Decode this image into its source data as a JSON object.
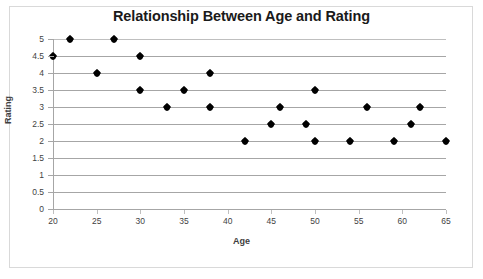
{
  "chart_data": {
    "type": "scatter",
    "title": "Relationship Between Age and Rating",
    "xlabel": "Age",
    "ylabel": "Rating",
    "xlim": [
      20,
      65
    ],
    "ylim": [
      0,
      5
    ],
    "xticks": [
      20,
      25,
      30,
      35,
      40,
      45,
      50,
      55,
      60,
      65
    ],
    "yticks": [
      0,
      0.5,
      1,
      1.5,
      2,
      2.5,
      3,
      3.5,
      4,
      4.5,
      5
    ],
    "ytick_labels": [
      "0",
      "0.5",
      "1",
      "1.5",
      "2",
      "2.5",
      "3",
      "3.5",
      "4",
      "4.5",
      "5"
    ],
    "xtick_labels": [
      "20",
      "25",
      "30",
      "35",
      "40",
      "45",
      "50",
      "55",
      "60",
      "65"
    ],
    "grid": true,
    "grid_axis": "y",
    "legend": false,
    "marker": "diamond",
    "marker_color": "#000000",
    "points": [
      {
        "x": 20,
        "y": 4.5
      },
      {
        "x": 22,
        "y": 5
      },
      {
        "x": 25,
        "y": 4
      },
      {
        "x": 27,
        "y": 5
      },
      {
        "x": 30,
        "y": 4.5
      },
      {
        "x": 30,
        "y": 3.5
      },
      {
        "x": 33,
        "y": 3
      },
      {
        "x": 35,
        "y": 3.5
      },
      {
        "x": 38,
        "y": 4
      },
      {
        "x": 38,
        "y": 3
      },
      {
        "x": 42,
        "y": 2
      },
      {
        "x": 45,
        "y": 2.5
      },
      {
        "x": 46,
        "y": 3
      },
      {
        "x": 49,
        "y": 2.5
      },
      {
        "x": 50,
        "y": 3.5
      },
      {
        "x": 50,
        "y": 2
      },
      {
        "x": 54,
        "y": 2
      },
      {
        "x": 56,
        "y": 3
      },
      {
        "x": 59,
        "y": 2
      },
      {
        "x": 61,
        "y": 2.5
      },
      {
        "x": 62,
        "y": 3
      },
      {
        "x": 65,
        "y": 2
      }
    ]
  },
  "colors": {
    "grid": "#a6a6a6",
    "axis": "#a6a6a6",
    "marker": "#000000",
    "title_text": "#1a1a1a",
    "label_text": "#3f3f3f",
    "frame_border": "#d9d9d9",
    "background": "#ffffff"
  }
}
